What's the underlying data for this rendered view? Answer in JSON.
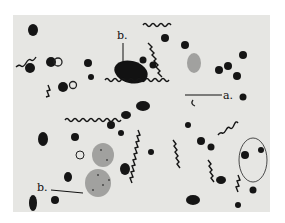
{
  "figure": {
    "type": "micrograph",
    "labels": {
      "a": "a.",
      "b_top": "b.",
      "b_bottom": "b."
    },
    "colors": {
      "background": "#e6e6e3",
      "stain": "#151515",
      "page": "#ffffff"
    }
  }
}
